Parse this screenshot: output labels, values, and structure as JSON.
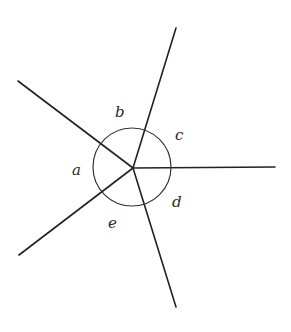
{
  "diagram": {
    "type": "angles-around-a-point",
    "vertex": {
      "x": 133,
      "y": 168
    },
    "rays": [
      {
        "name": "ray-upper-left",
        "x2": 18,
        "y2": 81
      },
      {
        "name": "ray-top",
        "x2": 176,
        "y2": 28
      },
      {
        "name": "ray-right",
        "x2": 275,
        "y2": 167
      },
      {
        "name": "ray-bottom",
        "x2": 176,
        "y2": 307
      },
      {
        "name": "ray-lower-left",
        "x2": 19,
        "y2": 255
      }
    ],
    "arc_circle": {
      "cx": 132,
      "cy": 167,
      "r": 39
    },
    "angle_labels": [
      {
        "text": "a",
        "x": 72,
        "y": 175
      },
      {
        "text": "b",
        "x": 115,
        "y": 117
      },
      {
        "text": "c",
        "x": 175,
        "y": 140
      },
      {
        "text": "d",
        "x": 172,
        "y": 207
      },
      {
        "text": "e",
        "x": 108,
        "y": 228
      }
    ],
    "colors": {
      "line": "#222222",
      "background": "#ffffff"
    }
  }
}
